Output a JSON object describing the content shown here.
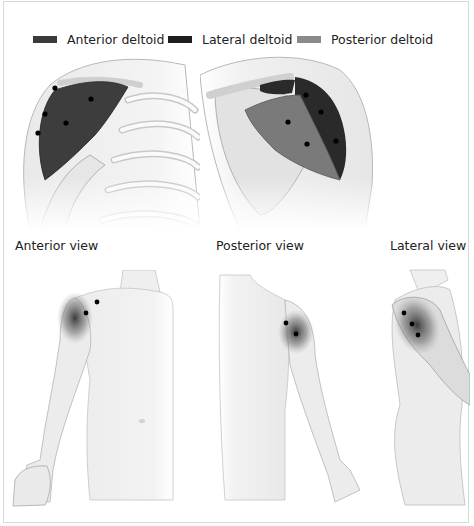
{
  "legend": {
    "items": [
      {
        "label": "Anterior deltoid",
        "color": "#3a3a3a"
      },
      {
        "label": "Lateral deltoid",
        "color": "#1e1e1e"
      },
      {
        "label": "Posterior deltoid",
        "color": "#8a8a8a"
      }
    ]
  },
  "panels": {
    "top_left": {
      "subject": "anterior shoulder close-up",
      "points": 5
    },
    "top_right": {
      "subject": "posterior shoulder close-up",
      "points": 5
    }
  },
  "views": [
    {
      "label": "Anterior view",
      "points": 2
    },
    {
      "label": "Posterior view",
      "points": 2
    },
    {
      "label": "Lateral view",
      "points": 3
    }
  ],
  "colors": {
    "skin": "#f0f0f0",
    "outline": "#9a9a9a",
    "muscle_dark": "#3a3a3a",
    "muscle_mid": "#6e6e6e",
    "muscle_light": "#8a8a8a",
    "point": "#000000",
    "frame_border": "#d8d8d8"
  }
}
